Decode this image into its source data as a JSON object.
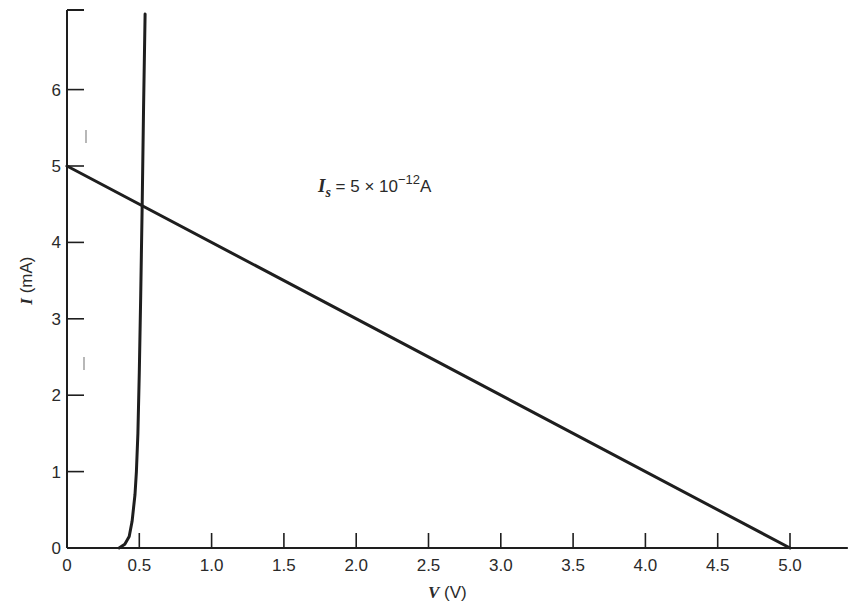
{
  "chart_data": {
    "type": "line",
    "title": "",
    "annotation": {
      "text_main": "I",
      "text_sub": "s",
      "text_rest": " = 5 × 10",
      "text_exp": "−12",
      "text_unit": "A",
      "full": "I_s = 5 × 10^-12 A",
      "x": 2.0,
      "y": 5.2
    },
    "xlabel": "V (V)",
    "xlabel_var": "V",
    "xlabel_unit": "(V)",
    "ylabel": "I (mA)",
    "ylabel_var": "I",
    "ylabel_unit": "(mA)",
    "xlim": [
      0,
      5.4
    ],
    "ylim": [
      0,
      7
    ],
    "xticks": [
      0,
      0.5,
      1.0,
      1.5,
      2.0,
      2.5,
      3.0,
      3.5,
      4.0,
      4.5,
      5.0
    ],
    "xtick_labels": [
      "0",
      "0.5",
      "1.0",
      "1.5",
      "2.0",
      "2.5",
      "3.0",
      "3.5",
      "4.0",
      "4.5",
      "5.0"
    ],
    "yticks": [
      0,
      1,
      2,
      3,
      4,
      5,
      6
    ],
    "ytick_labels": [
      "0",
      "1",
      "2",
      "3",
      "4",
      "5",
      "6"
    ],
    "grid": false,
    "legend": null,
    "series": [
      {
        "name": "Diode I-V curve",
        "x": [
          0.36,
          0.4,
          0.43,
          0.45,
          0.47,
          0.48,
          0.49,
          0.5,
          0.51,
          0.52,
          0.53,
          0.54
        ],
        "y": [
          0.0,
          0.05,
          0.15,
          0.35,
          0.7,
          1.0,
          1.5,
          2.3,
          3.3,
          4.5,
          5.8,
          7.0
        ]
      },
      {
        "name": "Load line",
        "x": [
          0,
          5.0
        ],
        "y": [
          5.0,
          0
        ]
      }
    ],
    "operating_point": {
      "x": 0.53,
      "y": 4.47
    }
  },
  "colors": {
    "line": "#1e1e1e",
    "text": "#2a2a2a",
    "background": "#ffffff"
  }
}
